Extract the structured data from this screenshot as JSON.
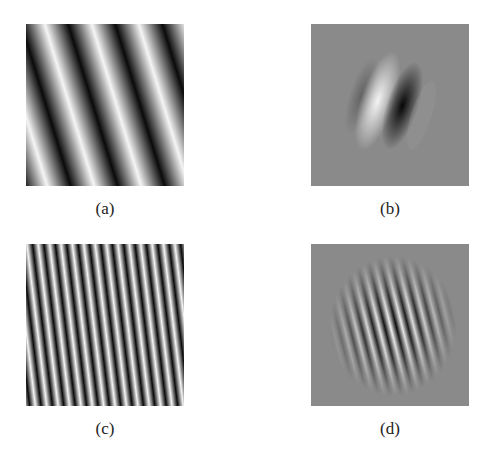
{
  "figure": {
    "panels": [
      {
        "id": "a",
        "caption": "(a)",
        "description": "Low-frequency sinusoidal grating, tilted"
      },
      {
        "id": "b",
        "caption": "(b)",
        "description": "Gabor filter, low frequency, on gray background"
      },
      {
        "id": "c",
        "caption": "(c)",
        "description": "High-frequency sinusoidal grating, tilted"
      },
      {
        "id": "d",
        "caption": "(d)",
        "description": "Gabor filter, high frequency, on gray background"
      }
    ],
    "colors": {
      "background": "#ffffff",
      "gabor_gray": "#8a8a8a",
      "dark": "#0a0a0a",
      "light": "#f5f5f5"
    }
  }
}
